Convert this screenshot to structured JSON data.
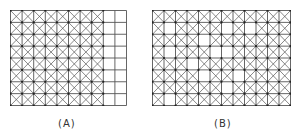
{
  "colors": {
    "line": "#555555",
    "node": "#222222",
    "background": "#ffffff",
    "label": "#333333"
  },
  "figure": {
    "panels": [
      {
        "id": "A",
        "label": "(A)",
        "cols": 10,
        "rows": 8,
        "description": "Left 8 columns fully crossed with diagonals; rightmost 2 columns plain squares",
        "crossed": [
          "1111111100",
          "1111111100",
          "1111111100",
          "1111111100",
          "1111111100",
          "1111111100",
          "1111111100",
          "1111111100"
        ]
      },
      {
        "id": "B",
        "label": "(B)",
        "cols": 12,
        "rows": 8,
        "description": "Crossed grid with scattered empty (uncrossed) cells",
        "crossed": [
          "111111111111",
          "101111010111",
          "111101111111",
          "101110011111",
          "111011111111",
          "111101101111",
          "111111011111",
          "101111111111"
        ]
      }
    ]
  }
}
